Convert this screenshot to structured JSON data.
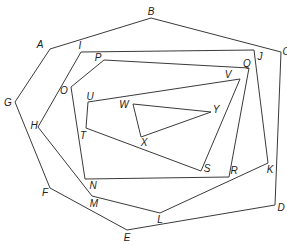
{
  "diagram": {
    "type": "nested-polygons",
    "stroke_color": "#3a3a3a",
    "background": "#ffffff",
    "polygons": [
      {
        "name": "outer-heptagon",
        "vertices": [
          "A",
          "B",
          "C",
          "D",
          "E",
          "F",
          "G"
        ],
        "points": "50,49 151,18 281,52 275,205 127,230 50,188 15,102"
      },
      {
        "name": "second-hexagon",
        "vertices": [
          "I",
          "J",
          "K",
          "L",
          "M",
          "H"
        ],
        "points": "81,52 254,50 268,163 160,213 92,196 38,127"
      },
      {
        "name": "third-pentagon",
        "vertices": [
          "P",
          "Q",
          "R",
          "N",
          "O"
        ],
        "points": "104,60 249,68 229,177 85,179 71,87"
      },
      {
        "name": "fourth-quadrilateral",
        "vertices": [
          "U",
          "V",
          "S",
          "T"
        ],
        "points": "88,102 240,79 201,171 86,128"
      },
      {
        "name": "inner-triangle",
        "vertices": [
          "W",
          "Y",
          "X"
        ],
        "points": "133,104 211,112 141,137"
      }
    ],
    "labels": [
      {
        "text": "A",
        "x": 40,
        "y": 45
      },
      {
        "text": "B",
        "x": 151,
        "y": 12
      },
      {
        "text": "C",
        "x": 286,
        "y": 52
      },
      {
        "text": "D",
        "x": 281,
        "y": 208
      },
      {
        "text": "E",
        "x": 127,
        "y": 238
      },
      {
        "text": "F",
        "x": 45,
        "y": 193
      },
      {
        "text": "G",
        "x": 8,
        "y": 103
      },
      {
        "text": "H",
        "x": 34,
        "y": 126
      },
      {
        "text": "I",
        "x": 80,
        "y": 46
      },
      {
        "text": "J",
        "x": 260,
        "y": 57
      },
      {
        "text": "K",
        "x": 270,
        "y": 170
      },
      {
        "text": "L",
        "x": 160,
        "y": 220
      },
      {
        "text": "M",
        "x": 94,
        "y": 204
      },
      {
        "text": "N",
        "x": 93,
        "y": 186
      },
      {
        "text": "O",
        "x": 64,
        "y": 91
      },
      {
        "text": "P",
        "x": 98,
        "y": 58
      },
      {
        "text": "Q",
        "x": 247,
        "y": 64
      },
      {
        "text": "R",
        "x": 234,
        "y": 171
      },
      {
        "text": "S",
        "x": 207,
        "y": 169
      },
      {
        "text": "T",
        "x": 83,
        "y": 136
      },
      {
        "text": "U",
        "x": 90,
        "y": 97
      },
      {
        "text": "V",
        "x": 228,
        "y": 75
      },
      {
        "text": "W",
        "x": 124,
        "y": 105
      },
      {
        "text": "X",
        "x": 144,
        "y": 143
      },
      {
        "text": "Y",
        "x": 216,
        "y": 110
      }
    ]
  }
}
